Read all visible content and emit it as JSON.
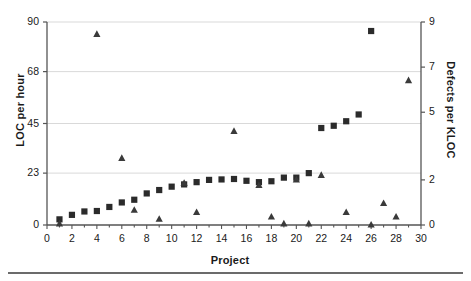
{
  "chart_data": {
    "type": "scatter",
    "title": "",
    "xlabel": "Project",
    "ylabel": "LOC per hour",
    "ylabel_secondary": "Defects per KLOC",
    "xlim": [
      0,
      30
    ],
    "ylim": [
      0,
      90
    ],
    "ylim_secondary": [
      0,
      9
    ],
    "grid": true,
    "legend_position": "none",
    "xticks": [
      0,
      2,
      4,
      6,
      8,
      10,
      12,
      14,
      16,
      18,
      20,
      22,
      24,
      26,
      28,
      30
    ],
    "xtick_labels": [
      "0",
      "2",
      "4",
      "6",
      "8",
      "10",
      "12",
      "14",
      "16",
      "18",
      "20",
      "22",
      "24",
      "26",
      "28",
      "30"
    ],
    "xminor_step": 1,
    "yticks": [
      0,
      23,
      45,
      68,
      90
    ],
    "ytick_labels": [
      "0",
      "23",
      "45",
      "68",
      "90"
    ],
    "yticks_secondary": [
      0,
      2,
      5,
      7,
      9
    ],
    "ytick_labels_secondary": [
      "0",
      "2",
      "5",
      "7",
      "9"
    ],
    "gridlines": [
      23,
      45,
      68,
      90
    ],
    "series": [
      {
        "name": "LOC per hour",
        "marker": "square",
        "color": "#2b2b2b",
        "axis": "left",
        "x": [
          1,
          2,
          3,
          4,
          5,
          6,
          7,
          8,
          9,
          10,
          11,
          12,
          13,
          14,
          15,
          16,
          17,
          18,
          19,
          20,
          21,
          22,
          23,
          24,
          25,
          26
        ],
        "values": [
          2.5,
          4.5,
          6.0,
          6.2,
          8.0,
          10.0,
          11.2,
          14.0,
          15.5,
          17.0,
          18.0,
          19.0,
          20.0,
          20.2,
          20.4,
          19.6,
          19.0,
          19.4,
          21.0,
          21.0,
          23.0,
          43.0,
          44.0,
          46.0,
          49.0,
          86.0
        ]
      },
      {
        "name": "Defects per KLOC",
        "marker": "triangle",
        "color": "#3a3a3a",
        "axis": "right",
        "x": [
          1,
          4,
          6,
          7,
          9,
          11,
          12,
          15,
          17,
          18,
          19,
          20,
          21,
          22,
          24,
          26,
          27,
          28,
          29
        ],
        "values": [
          0.05,
          8.45,
          2.95,
          0.65,
          0.25,
          1.85,
          0.55,
          4.15,
          1.75,
          0.35,
          0.05,
          2.0,
          0.05,
          2.2,
          0.55,
          0.0,
          0.95,
          0.35,
          6.4
        ]
      }
    ],
    "series_left_points": [
      {
        "x": 1,
        "y": 2.5
      },
      {
        "x": 2,
        "y": 4.5
      },
      {
        "x": 3,
        "y": 6.0
      },
      {
        "x": 4,
        "y": 6.2
      },
      {
        "x": 5,
        "y": 8.0
      },
      {
        "x": 6,
        "y": 10.0
      },
      {
        "x": 7,
        "y": 11.2
      },
      {
        "x": 8,
        "y": 14.0
      },
      {
        "x": 9,
        "y": 15.5
      },
      {
        "x": 10,
        "y": 17.0
      },
      {
        "x": 11,
        "y": 18.0
      },
      {
        "x": 12,
        "y": 19.0
      },
      {
        "x": 13,
        "y": 20.0
      },
      {
        "x": 14,
        "y": 20.2
      },
      {
        "x": 15,
        "y": 20.4
      },
      {
        "x": 16,
        "y": 19.6
      },
      {
        "x": 17,
        "y": 19.0
      },
      {
        "x": 18,
        "y": 19.4
      },
      {
        "x": 19,
        "y": 21.0
      },
      {
        "x": 20,
        "y": 21.0
      },
      {
        "x": 21,
        "y": 23.0
      },
      {
        "x": 22,
        "y": 43.0
      },
      {
        "x": 23,
        "y": 44.0
      },
      {
        "x": 24,
        "y": 46.0
      },
      {
        "x": 25,
        "y": 49.0
      },
      {
        "x": 26,
        "y": 86.0
      }
    ],
    "series_right_points": [
      {
        "x": 1,
        "y": 0.05
      },
      {
        "x": 4,
        "y": 8.45
      },
      {
        "x": 6,
        "y": 2.95
      },
      {
        "x": 7,
        "y": 0.65
      },
      {
        "x": 9,
        "y": 0.25
      },
      {
        "x": 11,
        "y": 1.85
      },
      {
        "x": 12,
        "y": 0.55
      },
      {
        "x": 15,
        "y": 4.15
      },
      {
        "x": 17,
        "y": 1.75
      },
      {
        "x": 18,
        "y": 0.35
      },
      {
        "x": 19,
        "y": 0.05
      },
      {
        "x": 20,
        "y": 2.0
      },
      {
        "x": 21,
        "y": 0.05
      },
      {
        "x": 22,
        "y": 2.2
      },
      {
        "x": 24,
        "y": 0.55
      },
      {
        "x": 26,
        "y": 0.0
      },
      {
        "x": 27,
        "y": 0.95
      },
      {
        "x": 28,
        "y": 0.35
      },
      {
        "x": 29,
        "y": 6.4
      }
    ],
    "colors": {
      "marker": "#2b2b2b",
      "axis": "#555555",
      "grid": "#d9d9d9",
      "text": "#1a1a1a",
      "rule": "#6b6b6b"
    }
  }
}
